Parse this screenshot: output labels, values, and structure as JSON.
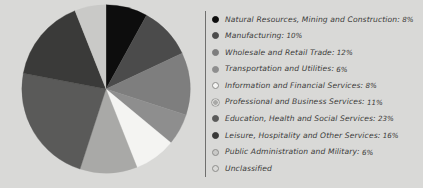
{
  "chart_data": {
    "type": "pie",
    "title": "",
    "subtitle": "",
    "xlabel": "",
    "ylabel": "",
    "legend_position": "right",
    "grid": false,
    "background_color": "#d9d9d7",
    "divider_color": "#6f6f6e",
    "start_angle_deg": 0,
    "direction": "clockwise",
    "categories": [
      "Natural Resources, Mining and Construction",
      "Manufacturing",
      "Wholesale and Retail Trade",
      "Transportation and Utilities",
      "Information and Financial Services",
      "Professional and Business Services",
      "Education, Health and Social Services",
      "Leisure, Hospitality and Other Services",
      "Public Administration and Military",
      "Unclassified"
    ],
    "values": [
      8,
      10,
      12,
      6,
      8,
      11,
      23,
      16,
      6,
      0
    ],
    "value_labels": [
      "8%",
      "10%",
      "12%",
      "6%",
      "8%",
      "11%",
      "23%",
      "16%",
      "6%",
      ""
    ],
    "colors": [
      "#0d0d0d",
      "#4b4b4b",
      "#7e7e7e",
      "#8e8e8e",
      "#f4f4f2",
      "#a9a9a7",
      "#5a5a59",
      "#3a3a39",
      "#c9c9c7",
      "#d9d9d7"
    ],
    "legend_marker_styles": [
      "filled",
      "filled",
      "filled",
      "filled",
      "outlined",
      "outlined-ring",
      "filled",
      "filled",
      "outlined",
      "outlined"
    ]
  },
  "legend": {
    "items": [
      {
        "label": "Natural Resources, Mining and Construction:",
        "pct": "8%",
        "color": "#0d0d0d",
        "style": "filled"
      },
      {
        "label": "Manufacturing:",
        "pct": "10%",
        "color": "#4b4b4b",
        "style": "filled"
      },
      {
        "label": "Wholesale and Retail Trade:",
        "pct": "12%",
        "color": "#7e7e7e",
        "style": "filled"
      },
      {
        "label": "Transportation and Utilities:",
        "pct": "6%",
        "color": "#8e8e8e",
        "style": "filled"
      },
      {
        "label": "Information and Financial Services:",
        "pct": "8%",
        "color": "#f4f4f2",
        "style": "outlined"
      },
      {
        "label": "Professional and Business Services:",
        "pct": "11%",
        "color": "#a9a9a7",
        "style": "outlined-ring"
      },
      {
        "label": "Education, Health and Social Services:",
        "pct": "23%",
        "color": "#5a5a59",
        "style": "filled"
      },
      {
        "label": "Leisure, Hospitality and Other Services:",
        "pct": "16%",
        "color": "#3a3a39",
        "style": "filled"
      },
      {
        "label": "Public Administration and Military:",
        "pct": "6%",
        "color": "#c9c9c7",
        "style": "outlined"
      },
      {
        "label": "Unclassified",
        "pct": "",
        "color": "#d9d9d7",
        "style": "outlined"
      }
    ]
  }
}
